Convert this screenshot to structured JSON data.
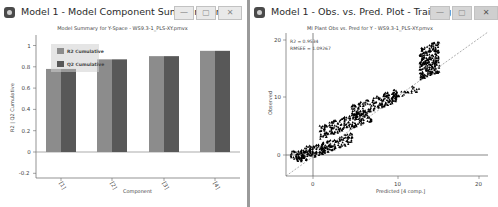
{
  "left_window": {
    "title": "Model 1 - Model Component Summary for Y-S",
    "buttons": {
      "minimize": "—",
      "maximize": "▢",
      "close": "✕"
    },
    "chart_title": "Model Summary for Y-Space - WS9.3-1_PLS-XY.pmvx"
  },
  "right_window": {
    "title": "Model 1 - Obs. vs. Pred. Plot - Training",
    "buttons": {
      "minimize": "—",
      "maximize": "▢",
      "close": "✕"
    },
    "chart_title": "MI Plant Obs vs. Pred for Y - WS9.3-1_PLS-XY.pmvx",
    "stats": {
      "r2": "R2 = 0.9534",
      "rmsee": "RMSEE = 1.09267"
    }
  },
  "chart_data": [
    {
      "type": "bar",
      "title": "Model Summary for Y-Space - WS9.3-1_PLS-XY.pmvx",
      "xlabel": "Component",
      "ylabel": "R2 | Q2 Cumulative",
      "categories": [
        "[1]",
        "[2]",
        "[3]",
        "[4]"
      ],
      "series": [
        {
          "name": "R2 Cumulative",
          "color": "#8c8c8c",
          "values": [
            0.78,
            0.87,
            0.9,
            0.95
          ]
        },
        {
          "name": "Q2 Cumulative",
          "color": "#585858",
          "values": [
            0.78,
            0.87,
            0.9,
            0.95
          ]
        }
      ],
      "ylim": [
        -0.2,
        1.1
      ],
      "yticks": [
        "1",
        "0.8",
        "0.6",
        "0.4",
        "0.2",
        "0",
        "-0.2"
      ],
      "legend_position": "top-left inside",
      "grid": false
    },
    {
      "type": "scatter",
      "title": "MI Plant Obs vs. Pred for Y - WS9.3-1_PLS-XY.pmvx",
      "xlabel": "Predicted [4 comp.]",
      "ylabel": "Observed",
      "xticks": [
        "0",
        "10",
        "20"
      ],
      "yticks": [
        "20",
        "10",
        "0"
      ],
      "xlim": [
        -3.5,
        21
      ],
      "ylim": [
        -3.5,
        21
      ],
      "annotations": [
        "R2 = 0.9534",
        "RMSEE = 1.09267"
      ],
      "reference_line": "y = x (dashed)",
      "clusters": [
        {
          "x_range": [
            -2,
            6
          ],
          "y_range": [
            0,
            3
          ]
        },
        {
          "x_range": [
            0,
            9
          ],
          "y_range": [
            3,
            8
          ]
        },
        {
          "x_range": [
            4,
            12
          ],
          "y_range": [
            7,
            12
          ]
        },
        {
          "x_range": [
            12,
            16
          ],
          "y_range": [
            10,
            20
          ]
        }
      ],
      "grid": false
    }
  ]
}
